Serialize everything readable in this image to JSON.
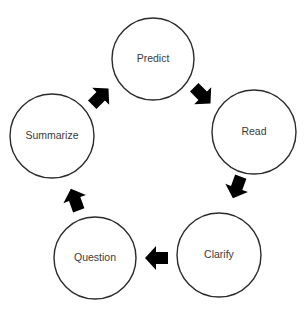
{
  "diagram": {
    "type": "cycle",
    "nodes": [
      {
        "id": "predict",
        "label": "Predict",
        "cx": 153,
        "cy": 59,
        "r": 41
      },
      {
        "id": "read",
        "label": "Read",
        "cx": 254,
        "cy": 132,
        "r": 42
      },
      {
        "id": "clarify",
        "label": "Clarify",
        "cx": 219,
        "cy": 255,
        "r": 42
      },
      {
        "id": "question",
        "label": "Question",
        "cx": 95,
        "cy": 258,
        "r": 41
      },
      {
        "id": "summarize",
        "label": "Summarize",
        "cx": 52,
        "cy": 136,
        "r": 42
      }
    ],
    "edges": [
      {
        "from": "predict",
        "to": "read",
        "x": 202,
        "y": 95,
        "angle": 45
      },
      {
        "from": "read",
        "to": "clarify",
        "x": 237,
        "y": 187,
        "angle": 110
      },
      {
        "from": "clarify",
        "to": "question",
        "x": 157,
        "y": 258,
        "angle": 180
      },
      {
        "from": "question",
        "to": "summarize",
        "x": 75,
        "y": 200,
        "angle": 250
      },
      {
        "from": "summarize",
        "to": "predict",
        "x": 100,
        "y": 97,
        "angle": 315
      }
    ],
    "colors": {
      "stroke": "#2a2a2a",
      "arrow": "#000000",
      "text": "#3a3a3a",
      "background": "#ffffff"
    }
  }
}
